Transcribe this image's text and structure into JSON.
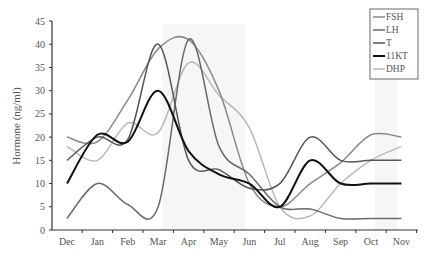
{
  "chart_data": {
    "type": "line",
    "title": "",
    "xlabel": "",
    "ylabel": "Hormone (ng/ml)",
    "ylim": [
      0,
      45
    ],
    "yticks": [
      0,
      5,
      10,
      15,
      20,
      25,
      30,
      35,
      40,
      45
    ],
    "categories": [
      "Dec",
      "Jan",
      "Feb",
      "Mar",
      "Apr",
      "May",
      "Jun",
      "Jul",
      "Aug",
      "Sep",
      "Oct",
      "Nov"
    ],
    "legend_position": "top-right",
    "shaded_regions": [
      [
        "Mar",
        "Jun"
      ],
      [
        "Oct",
        "Nov"
      ]
    ],
    "series": [
      {
        "name": "FSH",
        "color": "#8a8a8a",
        "width": 1.5,
        "values": [
          20,
          19,
          28,
          39,
          41,
          30,
          10,
          5,
          10,
          14.5,
          20.5,
          20
        ]
      },
      {
        "name": "LH",
        "color": "#6a6a6a",
        "width": 1.5,
        "values": [
          2.5,
          10,
          5.5,
          5,
          41,
          18,
          12,
          5,
          4.5,
          2.5,
          2.5,
          2.5
        ]
      },
      {
        "name": "T",
        "color": "#555555",
        "width": 1.5,
        "values": [
          15,
          20,
          19.5,
          40,
          15,
          13,
          9,
          10,
          20,
          15,
          15,
          15
        ]
      },
      {
        "name": "11KT",
        "color": "#111111",
        "width": 2,
        "values": [
          10,
          20.5,
          19,
          30,
          17,
          12,
          10,
          5,
          15,
          10,
          10,
          10
        ]
      },
      {
        "name": "DHP",
        "color": "#b8b8b8",
        "width": 1.5,
        "values": [
          18,
          15,
          23,
          21,
          36,
          29,
          22,
          5,
          3,
          10,
          15,
          18
        ]
      }
    ]
  }
}
